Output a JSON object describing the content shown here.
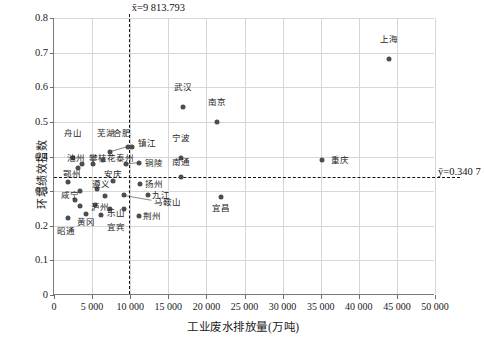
{
  "chart_data": {
    "type": "scatter",
    "title": "",
    "xlabel": "工业废水排放量(万吨)",
    "ylabel": "环境绩效指数",
    "xlim": [
      0,
      50000
    ],
    "ylim": [
      0,
      0.8
    ],
    "xticks": [
      0,
      5000,
      10000,
      15000,
      20000,
      25000,
      30000,
      35000,
      40000,
      45000,
      50000
    ],
    "xticklabels": [
      "0",
      "5 000",
      "10 000",
      "15 000",
      "20 000",
      "25 000",
      "30 000",
      "35 000",
      "40 000",
      "45 000",
      "50 000"
    ],
    "yticks": [
      0,
      0.1,
      0.2,
      0.3,
      0.4,
      0.5,
      0.6,
      0.7,
      0.8
    ],
    "yticklabels": [
      "0",
      "0.1",
      "0.2",
      "0.3",
      "0.4",
      "0.5",
      "0.6",
      "0.7",
      "0.8"
    ],
    "grid": true,
    "legend": "none",
    "annotations": {
      "x_mean_label": "x̄=9 813.793",
      "y_mean_label": "ȳ=0.340 7",
      "x_mean_value": 9813.793,
      "y_mean_value": 0.3407
    },
    "point_color": "#4d4d4d",
    "grid_color": "#d6d6d6",
    "points": [
      {
        "name": "上海",
        "x": 44000,
        "y": 0.683,
        "lx": 44000,
        "ly": 0.725,
        "pos": "above"
      },
      {
        "name": "重庆",
        "x": 35200,
        "y": 0.39,
        "lx": 36400,
        "ly": 0.39,
        "pos": "right"
      },
      {
        "name": "武汉",
        "x": 16900,
        "y": 0.543,
        "lx": 16900,
        "ly": 0.585,
        "pos": "above"
      },
      {
        "name": "南京",
        "x": 21400,
        "y": 0.5,
        "lx": 21400,
        "ly": 0.542,
        "pos": "above"
      },
      {
        "name": "宁波",
        "x": 16700,
        "y": 0.396,
        "lx": 16700,
        "ly": 0.438,
        "pos": "above"
      },
      {
        "name": "南通",
        "x": 16700,
        "y": 0.341,
        "lx": 16700,
        "ly": 0.371,
        "pos": "above"
      },
      {
        "name": "宜昌",
        "x": 21900,
        "y": 0.282,
        "lx": 21900,
        "ly": 0.262,
        "pos": "below"
      },
      {
        "name": "九江",
        "x": 12300,
        "y": 0.289,
        "lx": 12900,
        "ly": 0.289,
        "pos": "right"
      },
      {
        "name": "荆州",
        "x": 11100,
        "y": 0.228,
        "lx": 11700,
        "ly": 0.228,
        "pos": "right"
      },
      {
        "name": "扬州",
        "x": 11300,
        "y": 0.322,
        "lx": 11900,
        "ly": 0.322,
        "pos": "right"
      },
      {
        "name": "铜陵",
        "x": 11100,
        "y": 0.381,
        "lx": 11900,
        "ly": 0.381,
        "pos": "right"
      },
      {
        "name": "镇江",
        "x": 10300,
        "y": 0.428,
        "lx": 11000,
        "ly": 0.44,
        "pos": "right"
      },
      {
        "name": "合肥",
        "x": 9700,
        "y": 0.428,
        "lx": 8900,
        "ly": 0.452,
        "pos": "above"
      },
      {
        "name": "芜湖",
        "x": 7300,
        "y": 0.413,
        "lx": 6800,
        "ly": 0.452,
        "pos": "above"
      },
      {
        "name": "舟山",
        "x": 2500,
        "y": 0.396,
        "lx": 2500,
        "ly": 0.452,
        "pos": "above"
      },
      {
        "name": "泰州",
        "x": 9400,
        "y": 0.377,
        "lx": 8100,
        "ly": 0.395,
        "pos": "right"
      },
      {
        "name": "攀枝花",
        "x": 5100,
        "y": 0.378,
        "lx": 4600,
        "ly": 0.395,
        "pos": "right"
      },
      {
        "name": "池州",
        "x": 3100,
        "y": 0.366,
        "lx": 1700,
        "ly": 0.395,
        "pos": "right"
      },
      {
        "name": "安庆",
        "x": 7700,
        "y": 0.33,
        "lx": 6600,
        "ly": 0.35,
        "pos": "right"
      },
      {
        "name": "鄂州",
        "x": 1800,
        "y": 0.326,
        "lx": 1200,
        "ly": 0.35,
        "pos": "right"
      },
      {
        "name": "遵义",
        "x": 5600,
        "y": 0.305,
        "lx": 5000,
        "ly": 0.322,
        "pos": "right"
      },
      {
        "name": "马鞍山",
        "x": 9200,
        "y": 0.288,
        "lx": 13100,
        "ly": 0.27,
        "pos": "right"
      },
      {
        "name": "宜宾",
        "x": 9200,
        "y": 0.249,
        "lx": 8100,
        "ly": 0.208,
        "pos": "below"
      },
      {
        "name": "乐山",
        "x": 7400,
        "y": 0.249,
        "lx": 7000,
        "ly": 0.238,
        "pos": "right"
      },
      {
        "name": "泸州",
        "x": 5400,
        "y": 0.26,
        "lx": 4800,
        "ly": 0.255,
        "pos": "right"
      },
      {
        "name": "咸宁",
        "x": 2800,
        "y": 0.275,
        "lx": 900,
        "ly": 0.288,
        "pos": "right"
      },
      {
        "name": "黄冈",
        "x": 4200,
        "y": 0.235,
        "lx": 4200,
        "ly": 0.222,
        "pos": "below"
      },
      {
        "name": "昭通",
        "x": 1800,
        "y": 0.222,
        "lx": 1600,
        "ly": 0.196,
        "pos": "below"
      },
      {
        "name": "",
        "x": 3700,
        "y": 0.378,
        "lx": 0,
        "ly": 0,
        "pos": "none"
      },
      {
        "name": "",
        "x": 6400,
        "y": 0.39,
        "lx": 0,
        "ly": 0,
        "pos": "none"
      },
      {
        "name": "",
        "x": 3400,
        "y": 0.3,
        "lx": 0,
        "ly": 0,
        "pos": "none"
      },
      {
        "name": "",
        "x": 6700,
        "y": 0.285,
        "lx": 0,
        "ly": 0,
        "pos": "none"
      },
      {
        "name": "",
        "x": 3400,
        "y": 0.258,
        "lx": 0,
        "ly": 0,
        "pos": "none"
      },
      {
        "name": "",
        "x": 6200,
        "y": 0.232,
        "lx": 0,
        "ly": 0,
        "pos": "none"
      }
    ],
    "leaders": [
      {
        "x1": 9700,
        "y1": 0.428,
        "x2": 7300,
        "y2": 0.413
      },
      {
        "x1": 11100,
        "y1": 0.381,
        "x2": 9400,
        "y2": 0.377
      },
      {
        "x1": 9200,
        "y1": 0.288,
        "x2": 12800,
        "y2": 0.274
      }
    ]
  }
}
